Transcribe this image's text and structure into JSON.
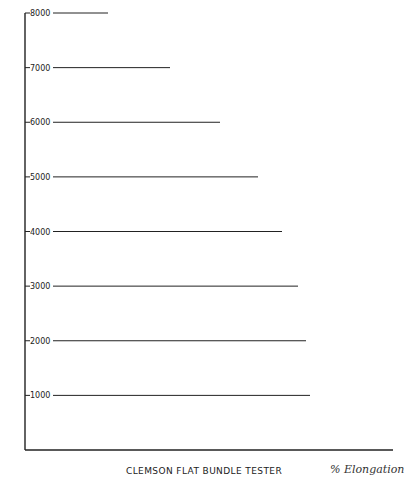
{
  "chart_data": {
    "type": "line",
    "title": "CLEMSON FLAT BUNDLE TESTER",
    "ylabel": "GRAMS LOAD ON SAMPLE",
    "ylabel_words": [
      "GRAMS",
      "LOAD",
      "ON",
      "SAMPLE"
    ],
    "xlabel": "% Elongation",
    "y_ticks": [
      1000,
      2000,
      3000,
      4000,
      5000,
      6000,
      7000,
      8000
    ],
    "y_tick_labels": [
      "1000",
      "2000",
      "3000",
      "4000",
      "5000",
      "6000",
      "7000",
      "8000"
    ],
    "ylim": [
      0,
      8000
    ],
    "x_ticks": [
      30,
      25,
      20,
      15,
      10,
      5,
      0
    ],
    "x_tick_labels": [
      "30",
      "25",
      "20",
      "15",
      "10",
      "5",
      "0"
    ],
    "xlim": [
      30,
      0
    ],
    "grid": true,
    "band_boundaries": {
      "load_grams": [
        0,
        1000,
        2000,
        3000,
        4000,
        5000,
        6000,
        7000,
        8000
      ],
      "left_edge_30pct_px": [
        310,
        310,
        306,
        298,
        282,
        258,
        220,
        170,
        108
      ],
      "right_edge_0pct_px": [
        393,
        392,
        387,
        376,
        360,
        337,
        300,
        253,
        196
      ]
    }
  },
  "colors": {
    "ink": "#222222",
    "background": "#ffffff",
    "grid_fine": "#555555"
  }
}
